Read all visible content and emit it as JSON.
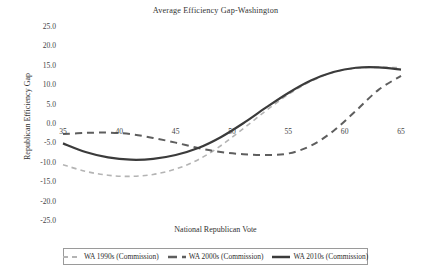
{
  "chart_data": {
    "type": "line",
    "title": "Average Efficiency Gap-Washington",
    "xlabel": "National Republican Vote",
    "ylabel": "Republican Efficiency Gap",
    "xlim": [
      35,
      65
    ],
    "ylim": [
      -25,
      25
    ],
    "xticks": [
      35,
      40,
      45,
      50,
      55,
      60,
      65
    ],
    "yticks": [
      25.0,
      20.0,
      15.0,
      10.0,
      5.0,
      0.0,
      -5.0,
      -10.0,
      -15.0,
      -20.0,
      -25.0
    ],
    "ytick_labels": [
      "25.0",
      "20.0",
      "15.0",
      "10.0",
      "5.0",
      "0.0",
      "-5.0",
      "-10.0",
      "-15.0",
      "-20.0",
      "-25.0"
    ],
    "xtick_labels": [
      "35",
      "40",
      "45",
      "50",
      "55",
      "60",
      "65"
    ],
    "grid": false,
    "legend_position": "below",
    "series": [
      {
        "name": "WA 1990s (Commission)",
        "style": "dashed",
        "color": "#b4b4b4",
        "width": 1.6,
        "x": [
          35,
          37,
          39,
          41,
          43,
          45,
          47,
          49,
          51,
          53,
          55,
          57,
          59,
          61,
          63,
          65
        ],
        "values": [
          -10.5,
          -12.2,
          -13.2,
          -13.5,
          -13.0,
          -11.6,
          -9.2,
          -5.6,
          -1.2,
          3.4,
          7.6,
          11.0,
          13.3,
          14.4,
          14.6,
          14.5
        ]
      },
      {
        "name": "WA 2000s (Commission)",
        "style": "dashed",
        "color": "#5e5e5e",
        "width": 2.0,
        "x": [
          35,
          37,
          39,
          41,
          43,
          45,
          47,
          49,
          51,
          53,
          55,
          57,
          59,
          61,
          63,
          65
        ],
        "values": [
          -2.6,
          -2.3,
          -2.2,
          -2.6,
          -3.6,
          -4.8,
          -6.2,
          -7.2,
          -7.8,
          -8.0,
          -7.6,
          -5.6,
          -1.8,
          3.4,
          8.8,
          12.4
        ]
      },
      {
        "name": "WA 2010s (Commission)",
        "style": "solid",
        "color": "#3b3b3b",
        "width": 2.2,
        "x": [
          35,
          37,
          39,
          41,
          43,
          45,
          47,
          49,
          51,
          53,
          55,
          57,
          59,
          61,
          63,
          65
        ],
        "values": [
          -5.0,
          -7.2,
          -8.6,
          -9.2,
          -9.0,
          -8.0,
          -6.2,
          -3.4,
          0.2,
          4.2,
          8.0,
          11.2,
          13.4,
          14.5,
          14.6,
          14.0
        ]
      }
    ]
  },
  "legend": {
    "entries": [
      {
        "label": "WA 1990s (Commission)"
      },
      {
        "label": "WA 2000s (Commission)"
      },
      {
        "label": "WA 2010s (Commission)"
      }
    ]
  }
}
